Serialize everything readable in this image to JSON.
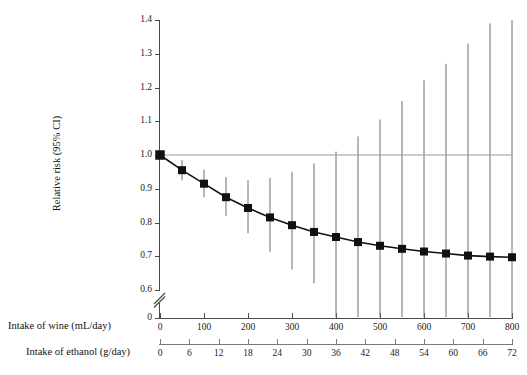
{
  "figure": {
    "y_axis_title": "Relative risk (95% CI)",
    "caption_wine": "Intake of wine (mL/day)",
    "caption_ethanol": "Intake of ethanol (g/day)"
  },
  "chart_data": {
    "type": "line",
    "title": "",
    "subtitle": "",
    "xlabel": "Intake of wine (mL/day)",
    "xlabel_secondary": "Intake of ethanol (g/day)",
    "ylabel": "Relative risk (95% CI)",
    "ylim": [
      0.6,
      1.4
    ],
    "y_ticks": [
      "0",
      "0.6",
      "0.7",
      "0.8",
      "0.9",
      "1.0",
      "1.1",
      "1.2",
      "1.3",
      "1.4"
    ],
    "y_axis_break": true,
    "y_axis_break_between": [
      0,
      0.6
    ],
    "x_ticks_wine": [
      "0",
      "100",
      "200",
      "300",
      "400",
      "500",
      "600",
      "700",
      "800"
    ],
    "x_ticks_ethanol": [
      "0",
      "6",
      "12",
      "18",
      "24",
      "30",
      "36",
      "42",
      "48",
      "54",
      "60",
      "66",
      "72"
    ],
    "xlim_wine": [
      0,
      800
    ],
    "xlim_ethanol": [
      0,
      72
    ],
    "grid": false,
    "legend": null,
    "reference_line": {
      "y": 1.0,
      "label": "null effect",
      "color": "#9a9a9a"
    },
    "marker_style": "filled-square",
    "line_color": "#111111",
    "errorbar_color": "#6e6e6e",
    "x": [
      0,
      50,
      100,
      150,
      200,
      250,
      300,
      350,
      400,
      450,
      500,
      550,
      600,
      650,
      700,
      750,
      800
    ],
    "x_ethanol": [
      0,
      4.5,
      9,
      13.5,
      18,
      22.5,
      27,
      31.5,
      36,
      40.5,
      45,
      49.5,
      54,
      58.5,
      63,
      67.5,
      72
    ],
    "values": [
      1.0,
      0.955,
      0.915,
      0.875,
      0.843,
      0.815,
      0.792,
      0.772,
      0.757,
      0.742,
      0.731,
      0.722,
      0.714,
      0.708,
      0.702,
      0.699,
      0.697
    ],
    "ci_lower": [
      1.0,
      0.925,
      0.875,
      0.82,
      0.768,
      0.713,
      0.661,
      0.62,
      0.6,
      0.6,
      0.6,
      0.6,
      0.6,
      0.6,
      0.6,
      0.6,
      0.6
    ],
    "ci_upper": [
      1.0,
      0.985,
      0.957,
      0.935,
      0.925,
      0.932,
      0.95,
      0.975,
      1.01,
      1.055,
      1.105,
      1.16,
      1.222,
      1.27,
      1.33,
      1.39,
      1.4
    ]
  }
}
